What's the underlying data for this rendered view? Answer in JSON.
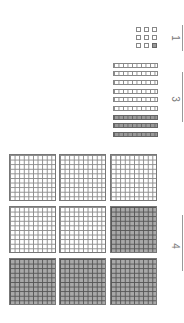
{
  "worksheet": {
    "orientation": "rotated-90",
    "hundreds": {
      "total_blocks": 9,
      "shaded": [
        false,
        false,
        false,
        false,
        false,
        true,
        true,
        true,
        true
      ],
      "answer": "4"
    },
    "tens": {
      "total_rods": 9,
      "shaded": [
        false,
        false,
        false,
        false,
        false,
        false,
        true,
        true,
        true
      ],
      "answer": "3"
    },
    "ones": {
      "total_units": 9,
      "shaded": [
        false,
        false,
        false,
        false,
        false,
        false,
        false,
        false,
        true
      ],
      "answer": "1"
    },
    "colors": {
      "shaded_fill": "#a9a9a9",
      "grid_line": "#8a8a8a",
      "answer_text": "#777777"
    }
  }
}
